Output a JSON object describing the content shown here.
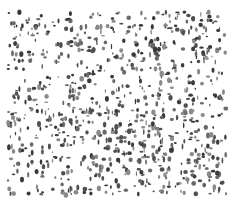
{
  "image": {
    "kind": "speckle-texture",
    "width": 239,
    "height": 203,
    "background": "#ffffff",
    "ink_colors": [
      "#3a3a3a",
      "#505050",
      "#6a6a6a",
      "#8a8a8a"
    ],
    "region": {
      "x": 8,
      "y": 12,
      "w": 218,
      "h": 183
    },
    "blob_count": 900,
    "seed": 7
  }
}
